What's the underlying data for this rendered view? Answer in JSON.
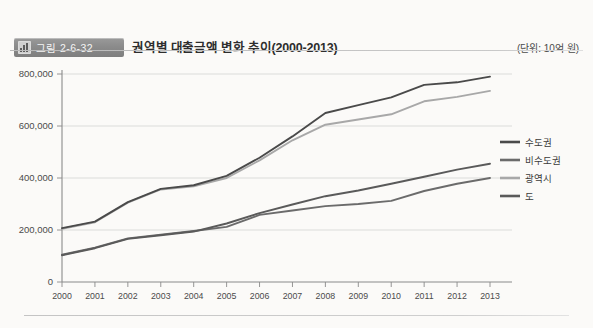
{
  "header": {
    "badge_label": "그림 2-6-32",
    "badge_icon": "bar-chart-icon",
    "title": "권역별 대출금액 변화 추이(2000-2013)",
    "unit_note": "(단위: 10억 원)"
  },
  "colors": {
    "series_dark": "#4a4a4a",
    "series_mid": "#6b6b6b",
    "series_light": "#a8a8a8",
    "grid": "#cfcfcf",
    "axis": "#8a8a8a",
    "badge_bg": "#8b8b8b",
    "page_bg": "#fbfaf8"
  },
  "chart_data": {
    "type": "line",
    "title": "권역별 대출금액 변화 추이(2000-2013)",
    "xlabel": "",
    "ylabel": "",
    "unit": "10억 원",
    "grid": true,
    "legend_position": "right",
    "ylim": [
      0,
      800000
    ],
    "yticks": [
      0,
      200000,
      400000,
      600000,
      800000
    ],
    "ytick_labels": [
      "0",
      "200,000",
      "400,000",
      "600,000",
      "800,000"
    ],
    "categories": [
      "2000",
      "2001",
      "2002",
      "2003",
      "2004",
      "2005",
      "2006",
      "2007",
      "2008",
      "2009",
      "2010",
      "2011",
      "2012",
      "2013"
    ],
    "series": [
      {
        "name": "수도권",
        "color": "#4a4a4a",
        "values": [
          207000,
          232000,
          307000,
          358000,
          372000,
          408000,
          478000,
          560000,
          650000,
          680000,
          710000,
          758000,
          768000,
          790000
        ]
      },
      {
        "name": "비수도권",
        "color": "#6b6b6b",
        "values": [
          105000,
          132000,
          168000,
          182000,
          196000,
          212000,
          258000,
          275000,
          292000,
          300000,
          312000,
          350000,
          378000,
          400000
        ]
      },
      {
        "name": "광역시",
        "color": "#a8a8a8",
        "values": [
          205000,
          230000,
          305000,
          356000,
          368000,
          400000,
          468000,
          545000,
          605000,
          625000,
          645000,
          695000,
          712000,
          735000
        ]
      },
      {
        "name": "도",
        "color": "#5a5a5a",
        "values": [
          103000,
          130000,
          166000,
          180000,
          194000,
          225000,
          265000,
          298000,
          330000,
          352000,
          378000,
          405000,
          432000,
          455000
        ]
      }
    ]
  }
}
